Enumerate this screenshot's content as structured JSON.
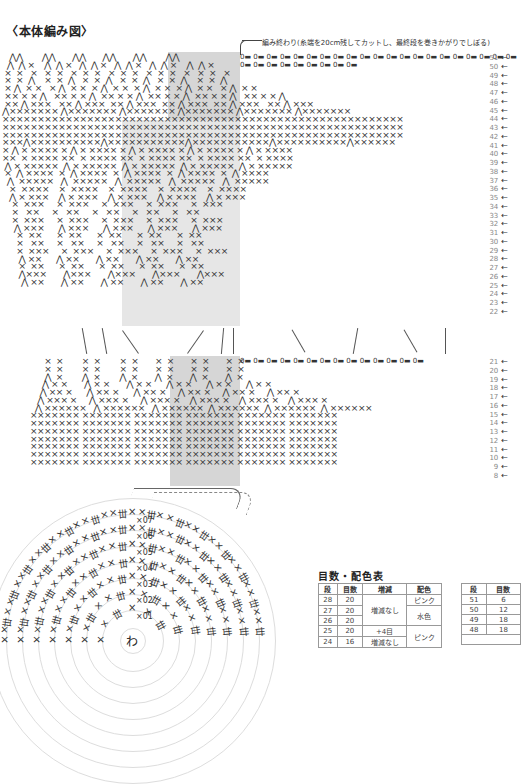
{
  "header": {
    "title": "〈本体編み図〉",
    "finish_note": "編み終わり(糸端を20cm残してカットし、最終段を巻きかがりでしぼる)"
  },
  "symbols": {
    "single_crochet": "×",
    "increase": "⋀",
    "decrease": "⋀",
    "chain": "0",
    "slip_stitch": "▬",
    "magic_ring": "わ",
    "arrow": "←"
  },
  "upper_section": {
    "rows": [
      "51",
      "50",
      "49",
      "48",
      "47",
      "46",
      "45",
      "44",
      "43",
      "42",
      "41",
      "40",
      "39",
      "38",
      "37",
      "36",
      "35",
      "34",
      "33",
      "32",
      "31",
      "30",
      "29",
      "28",
      "27",
      "26",
      "25",
      "24",
      "23",
      "22"
    ],
    "lines": [
      "   ⋀⋀        ⋀⋀       ⋀⋀       ⋀⋀       ⋀⋀        ⋀⋀",
      "  ⋀  ⋀ ×    ⋀  ⋀ ×   ⋀  ⋀ ×   ⋀  ⋀ ×   ⋀  ⋀ ×    ⋀  ⋀ ×",
      " ×  ×   ×   ×  ×   ×  ×  ×   ×  ×  ×   ×  ×  ×   ×   ×  ×   ×",
      " ×  ×  ⋀    ×  ×  ⋀   ×  ×  ⋀   ×  ×  ⋀   ×  ×  ⋀    ×  ×  ⋀",
      " × ⋀  × ×   × ⋀  × ×  × ⋀  × ×  × ⋀  × ×  × ⋀  × ×   × ⋀  × ×",
      " ×× × × ⋀   ×× × × ⋀  ×× × × ⋀  ×× × × ⋀  ×× × × ⋀   ×× × × ⋀",
      " ×× ⋀ ×××   ×× ⋀ ×××  ×× ⋀ ×××  ×× ⋀ ×××  ×× ⋀ ×××   ×× ⋀ ×××",
      "⋀××××××× ⋀××××××× ⋀××××××× ⋀××××××× ⋀××××××× ⋀×××××××",
      "×××××××××××××××××××××××××××××××××××××××××××××××××××××××××",
      "×××××××××××××××××××××××××××××××××××××××××××××××××××××××××",
      "×××××××××××××××××××××××××××××××××××××××××××××××××××××××××",
      "×××⋀××××××××××⋀×××××××××××⋀×××××××××××⋀××××××××××⋀××××××",
      "× ⋀ × ×××× × ⋀ × ×××× × ⋀ × ×××× × ⋀ × ×××× × ⋀ × ××××",
      "××  × ×××× ××  × ×××× ××  × ×××× ××  × ×××× ××  × ××××",
      " ⋀ × ×××××  ⋀ × ×××××  ⋀ × ×××××  ⋀ × ×××××  ⋀ × ×××××",
      " ×  ⋀ ××××  ×  ⋀ ××××  ×  ⋀ ××××  ×  ⋀ ××××  ×  ⋀ ××××",
      "  ⋀  ×××××   ⋀  ×××××   ⋀  ×××××   ⋀  ×××××   ⋀  ×××××",
      "   ×  ××××    ×  ××××    ×  ××××    ×  ××××    ×  ××××",
      "   ⋀ × ×××    ⋀ × ×××    ⋀ × ×××    ⋀ × ×××    ⋀ × ×××",
      "    ×  ×××     ×  ×××     ×  ×××     ×  ×××     ×  ×××",
      "    ×   ××     ×   ××     ×   ××     ×   ××     ×   ××",
      "    ×  ×××     ×  ×××     ×  ×××     ×  ×××     ×  ×××",
      "     ⋀ ×××      ⋀ ×××      ⋀ ×××      ⋀ ×××      ⋀ ×××",
      "      ×  ××      ×  ××      ×  ××      ×  ××      ×  ××",
      "      ×   ××     ×   ××     ×   ××     ×   ××     ×   ××",
      "      ×  ×××     ×  ×××     ×  ×××     ×  ×××     ×  ×××",
      "       ⋀ ××      ⋀ ××       ⋀ ××       ⋀ ××       ⋀ ××",
      "       ×  ××      ×  ××      ×  ××      ×  ××      ×  ××",
      "       ⋀×××       ⋀×××       ⋀×××       ⋀×××       ⋀×××",
      "        ⋀ ××       ⋀ ××       ⋀ ××       ⋀ ××       ⋀ ××"
    ]
  },
  "lower_section": {
    "rows": [
      "21",
      "20",
      "19",
      "18",
      "17",
      "16",
      "15",
      "14",
      "13",
      "12",
      "11",
      "10",
      "9",
      "8"
    ],
    "lines": [
      "      ×  ×        ×  ×        ×  ×       ×  ×       ×  ×       ×  ×",
      "      ×  ×        ×  ×        ×  ×       ×  ×       ×  ×       ×  ×",
      "      ⋀  ×        ⋀  ×        ⋀  ×       ⋀  ×       ⋀  ×       ⋀  ×",
      "     ⋀ × ×       ⋀ × ×       ⋀ × ×      ⋀ × ×      ⋀ × ×      ⋀ × ×",
      "    ⋀ ×× ×      ⋀ ×× ×      ⋀ ×× ×     ⋀ ×× ×     ⋀ ×× ×     ⋀ ×× ×",
      "   ⋀ ××× ×     ⋀ ××× ×     ⋀ ××× ×    ⋀ ××× ×    ⋀ ××× ×    ⋀ ××× ×",
      "  ⋀ ××××××   ⋀ ××××××   ⋀ ××××××  ⋀ ××××××  ⋀ ××××××  ⋀ ××××××",
      "××××××× ××××××× ××××××× ××××××× ××××××× ×××××××",
      "××××××× ××××××× ××××××× ××××××× ××××××× ×××××××",
      "××××××× ××××××× ××××××× ××××××× ××××××× ×××××××",
      "××××××× ××××××× ××××××× ××××××× ××××××× ×××××××",
      "××××××× ××××××× ××××××× ××××××× ××××××× ×××××××",
      "××××××× ××××××× ××××××× ××××××× ××××××× ×××××××",
      "××××××× ××××××× ××××××× ××××××× ××××××× ×××××××"
    ]
  },
  "circle_section": {
    "center": "わ",
    "round_labels": [
      "1",
      "2",
      "3",
      "4",
      "5",
      "6",
      "7"
    ]
  },
  "table": {
    "title": "目数・配色表",
    "left": {
      "headers": [
        "段",
        "目数",
        "増減",
        "配色"
      ],
      "rows": [
        {
          "row": "28",
          "count": "20",
          "change": "増減なし",
          "color": "ピンク"
        },
        {
          "row": "27",
          "count": "20",
          "change": "",
          "color": "水色"
        },
        {
          "row": "26",
          "count": "20",
          "change": "",
          "color": ""
        },
        {
          "row": "25",
          "count": "20",
          "change": "+4目",
          "color": "ピンク"
        },
        {
          "row": "24",
          "count": "16",
          "change": "増減なし",
          "color": ""
        }
      ]
    },
    "right": {
      "headers": [
        "段",
        "目数"
      ],
      "rows": [
        {
          "row": "51",
          "count": "6"
        },
        {
          "row": "50",
          "count": "12"
        },
        {
          "row": "49",
          "count": "18"
        },
        {
          "row": "48",
          "count": "18"
        }
      ]
    }
  }
}
